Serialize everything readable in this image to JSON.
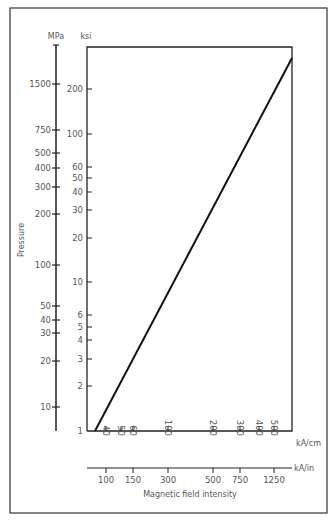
{
  "chart_data": {
    "type": "line",
    "title": "",
    "xlabel": "Magnetic field intensity",
    "ylabel": "Pressure",
    "x_axes": [
      {
        "unit": "kA/cm",
        "ticks": [
          40,
          50,
          60,
          100,
          200,
          300,
          400,
          500
        ],
        "scale": "log"
      },
      {
        "unit": "kA/in",
        "ticks": [
          100,
          150,
          300,
          500,
          750,
          1250
        ],
        "scale": "log"
      }
    ],
    "y_axes": [
      {
        "unit": "MPa",
        "ticks": [
          10,
          20,
          30,
          40,
          50,
          100,
          200,
          300,
          400,
          500,
          750,
          1500
        ],
        "scale": "log"
      },
      {
        "unit": "ksi",
        "ticks": [
          1,
          2,
          3,
          4,
          5,
          6,
          10,
          20,
          30,
          40,
          50,
          60,
          100,
          200
        ],
        "scale": "log"
      }
    ],
    "series": [
      {
        "name": "Pressure vs magnetic field intensity",
        "x_unit": "kA/cm",
        "y_unit": "ksi",
        "x": [
          33,
          560
        ],
        "y": [
          1,
          260
        ]
      }
    ],
    "xlim": [
      30,
      620
    ],
    "ylim": [
      1,
      320
    ],
    "grid": false,
    "legend": null
  },
  "labels": {
    "mpa": "MPa",
    "ksi": "ksi",
    "pressure": "Pressure",
    "kacm": "kA/cm",
    "kain": "kA/in",
    "xtitle": "Magnetic field intensity"
  },
  "ticks": {
    "mpa": [
      {
        "label": "1500",
        "y": 84
      },
      {
        "label": "750",
        "y": 130
      },
      {
        "label": "500",
        "y": 153
      },
      {
        "label": "400",
        "y": 168
      },
      {
        "label": "300",
        "y": 187
      },
      {
        "label": "200",
        "y": 214
      },
      {
        "label": "100",
        "y": 265
      },
      {
        "label": "50",
        "y": 306
      },
      {
        "label": "40",
        "y": 320
      },
      {
        "label": "30",
        "y": 333
      },
      {
        "label": "20",
        "y": 361
      },
      {
        "label": "10",
        "y": 407
      }
    ],
    "ksi": [
      {
        "label": "200",
        "y": 89
      },
      {
        "label": "100",
        "y": 134
      },
      {
        "label": "60",
        "y": 167
      },
      {
        "label": "50",
        "y": 178
      },
      {
        "label": "40",
        "y": 192
      },
      {
        "label": "30",
        "y": 210
      },
      {
        "label": "20",
        "y": 238
      },
      {
        "label": "10",
        "y": 282
      },
      {
        "label": "6",
        "y": 315
      },
      {
        "label": "5",
        "y": 327
      },
      {
        "label": "4",
        "y": 340
      },
      {
        "label": "3",
        "y": 359
      },
      {
        "label": "2",
        "y": 386
      },
      {
        "label": "1",
        "y": 431
      }
    ],
    "kacm": [
      {
        "label": "40",
        "x": 106
      },
      {
        "label": "50",
        "x": 121
      },
      {
        "label": "60",
        "x": 133
      },
      {
        "label": "100",
        "x": 168
      },
      {
        "label": "200",
        "x": 213
      },
      {
        "label": "300",
        "x": 240
      },
      {
        "label": "400",
        "x": 259
      },
      {
        "label": "500",
        "x": 274
      }
    ],
    "kain": [
      {
        "label": "100",
        "x": 106
      },
      {
        "label": "150",
        "x": 133
      },
      {
        "label": "300",
        "x": 168
      },
      {
        "label": "500",
        "x": 213
      },
      {
        "label": "750",
        "x": 240
      },
      {
        "label": "1250",
        "x": 274
      }
    ]
  }
}
